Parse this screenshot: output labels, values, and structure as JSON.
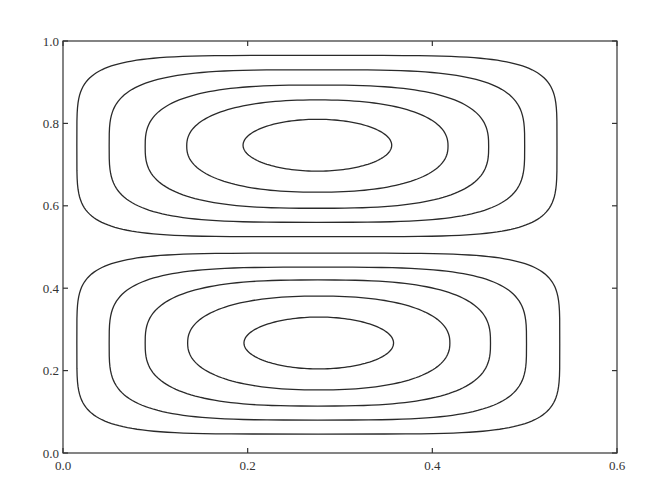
{
  "chart_data": {
    "type": "contour",
    "title": "",
    "xlabel": "",
    "ylabel": "",
    "xlim": [
      0.0,
      0.6
    ],
    "ylim": [
      0.0,
      1.0
    ],
    "grid": false,
    "legend": null,
    "x_ticks": [
      "0.0",
      "0.2",
      "0.4",
      "0.6"
    ],
    "y_ticks": [
      "0.0",
      "0.2",
      "0.4",
      "0.6",
      "0.8",
      "1.0"
    ],
    "x_tick_values": [
      0.0,
      0.2,
      0.4,
      0.6
    ],
    "y_tick_values": [
      0.0,
      0.2,
      0.4,
      0.6,
      0.8,
      1.0
    ],
    "line_color": "#2a2a2a",
    "cells": [
      {
        "name": "upper-cell",
        "center": [
          0.275,
          0.745
        ],
        "contours": [
          {
            "level": 1,
            "x": [
              0.015,
              0.535
            ],
            "y": [
              0.525,
              0.965
            ],
            "squareness": 5.0
          },
          {
            "level": 2,
            "x": [
              0.05,
              0.5
            ],
            "y": [
              0.56,
              0.93
            ],
            "squareness": 3.6
          },
          {
            "level": 3,
            "x": [
              0.089,
              0.461
            ],
            "y": [
              0.594,
              0.893
            ],
            "squareness": 2.8
          },
          {
            "level": 4,
            "x": [
              0.134,
              0.417
            ],
            "y": [
              0.633,
              0.857
            ],
            "squareness": 2.3
          },
          {
            "level": 5,
            "x": [
              0.195,
              0.356
            ],
            "y": [
              0.684,
              0.81
            ],
            "squareness": 2.0
          }
        ]
      },
      {
        "name": "lower-cell",
        "center": [
          0.275,
          0.255
        ],
        "contours": [
          {
            "level": 1,
            "x": [
              0.015,
              0.538
            ],
            "y": [
              0.046,
              0.485
            ],
            "squareness": 5.0
          },
          {
            "level": 2,
            "x": [
              0.05,
              0.502
            ],
            "y": [
              0.08,
              0.451
            ],
            "squareness": 3.6
          },
          {
            "level": 3,
            "x": [
              0.089,
              0.463
            ],
            "y": [
              0.114,
              0.42
            ],
            "squareness": 2.8
          },
          {
            "level": 4,
            "x": [
              0.135,
              0.419
            ],
            "y": [
              0.153,
              0.381
            ],
            "squareness": 2.3
          },
          {
            "level": 5,
            "x": [
              0.196,
              0.358
            ],
            "y": [
              0.204,
              0.33
            ],
            "squareness": 2.0
          }
        ]
      }
    ]
  },
  "layout": {
    "plot_left": 63,
    "plot_right": 617,
    "plot_top": 41,
    "plot_bottom": 453
  }
}
